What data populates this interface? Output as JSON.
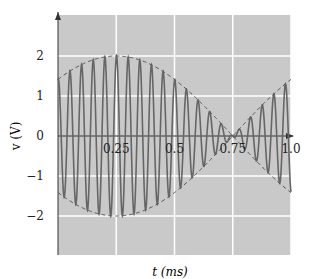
{
  "chart_data": {
    "type": "line",
    "title": "",
    "xlabel": "t (ms)",
    "ylabel": "v (V)",
    "xlim": [
      0,
      1.0
    ],
    "ylim": [
      -3,
      3
    ],
    "x_ticks": [
      "0.25",
      "0.5",
      "0.75",
      "1.0"
    ],
    "y_ticks": [
      "2",
      "1",
      "0",
      "-1",
      "-2"
    ],
    "grid": true,
    "series": [
      {
        "name": "modulated signal",
        "style": "solid",
        "description": "carrier ~20 cycles/ms with amplitude envelope 2cos(pi(t-0.25))"
      },
      {
        "name": "upper envelope",
        "style": "dashed",
        "peak": 2,
        "peak_t": 0.25,
        "zero_t": 0.75
      },
      {
        "name": "lower envelope",
        "style": "dashed",
        "peak": -2,
        "peak_t": 0.25,
        "zero_t": 0.75
      }
    ]
  },
  "colors": {
    "background": "#c8c8c8",
    "grid": "#ffffff",
    "signal": "#666666",
    "envelope": "#555555"
  }
}
